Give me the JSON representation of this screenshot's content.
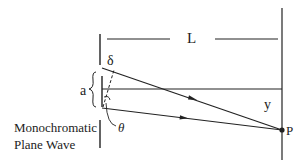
{
  "diagram": {
    "labels": {
      "distance": "L",
      "slit_width": "a",
      "path_difference": "δ",
      "angle": "θ",
      "screen_offset": "y",
      "point": "P",
      "source_line1": "Monochromatic",
      "source_line2": "Plane Wave"
    },
    "colors": {
      "stroke": "#222222",
      "background": "#ffffff"
    }
  }
}
